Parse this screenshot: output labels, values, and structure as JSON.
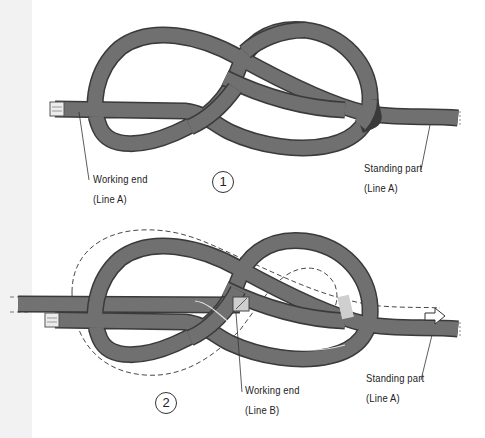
{
  "figure": {
    "type": "knot-tying-diagram",
    "colors": {
      "rope_fill": "#6e6e6e",
      "rope_edge": "#3a3a3a",
      "rope_highlight": "#9a9a9a",
      "rope_end_cap": "#e8e8e8",
      "leader_line": "#333333",
      "dashed_path": "#333333",
      "background": "#ffffff",
      "left_strip": "#f2f2f2"
    }
  },
  "step1": {
    "number": "1",
    "labels": {
      "working_end_title": "Working end",
      "working_end_line": "(Line A)",
      "standing_part_title": "Standing part",
      "standing_part_line": "(Line A)"
    }
  },
  "step2": {
    "number": "2",
    "labels": {
      "working_end_title": "Working end",
      "working_end_line": "(Line B)",
      "standing_part_title": "Standing part",
      "standing_part_line": "(Line A)"
    },
    "arrow_icon": "arrow-right-outline"
  }
}
